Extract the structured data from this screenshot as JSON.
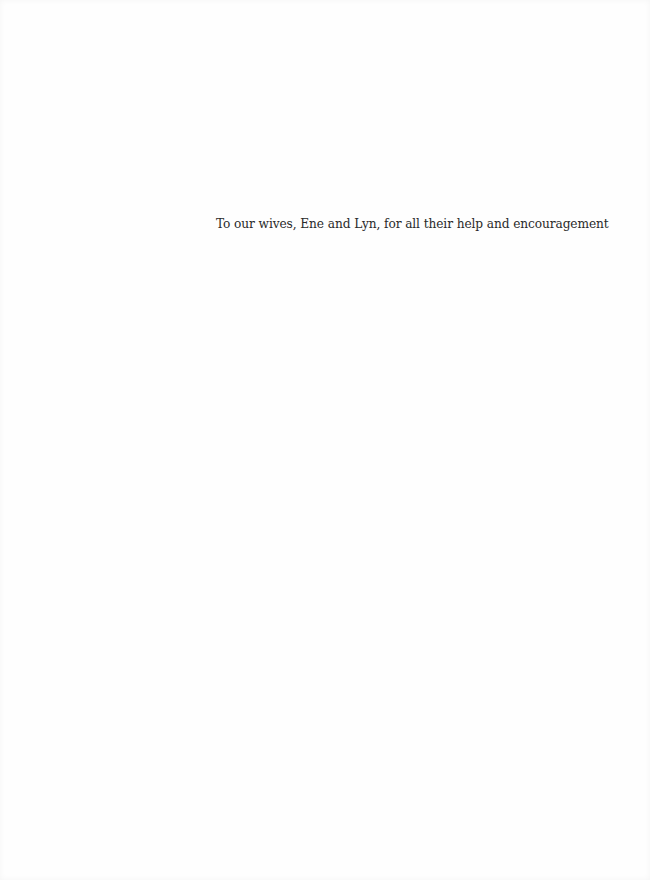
{
  "page": {
    "type": "dedication",
    "dedication": {
      "text": "To our wives, Ene and Lyn, for all their help and encouragement"
    }
  }
}
